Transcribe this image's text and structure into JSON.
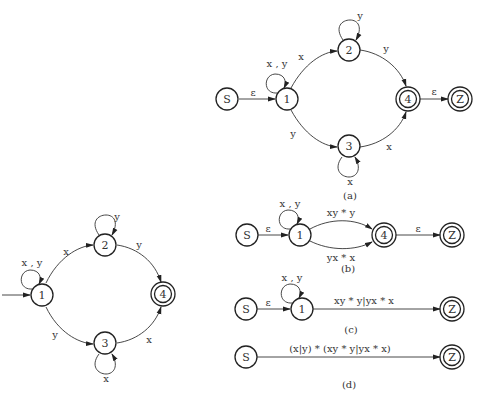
{
  "left_diagram": {
    "states": [
      "1",
      "2",
      "3",
      "4"
    ],
    "edges": {
      "loop_1": "x , y",
      "e_1_2": "x",
      "e_1_3": "y",
      "loop_2": "y",
      "loop_3": "x",
      "e_2_4": "y",
      "e_3_4": "x"
    }
  },
  "diagram_a": {
    "caption": "(a)",
    "states": [
      "S",
      "1",
      "2",
      "3",
      "4",
      "Z"
    ],
    "edges": {
      "e_S_1": "ε",
      "loop_1": "x , y",
      "e_1_2": "x",
      "e_1_3": "y",
      "loop_2": "y",
      "loop_3": "x",
      "e_2_4": "y",
      "e_3_4": "x",
      "e_4_Z": "ε"
    }
  },
  "diagram_b": {
    "caption": "(b)",
    "states": [
      "S",
      "1",
      "4",
      "Z"
    ],
    "edges": {
      "e_S_1": "ε",
      "loop_1": "x , y",
      "e_1_4_top": "xy * y",
      "e_1_4_bottom": "yx * x",
      "e_4_Z": "ε"
    }
  },
  "diagram_c": {
    "caption": "(c)",
    "states": [
      "S",
      "1",
      "Z"
    ],
    "edges": {
      "e_S_1": "ε",
      "loop_1": "x , y",
      "e_1_Z": "xy * y|yx * x"
    }
  },
  "diagram_d": {
    "caption": "(d)",
    "states": [
      "S",
      "Z"
    ],
    "edges": {
      "e_S_Z": "(x|y) * (xy * y|yx * x)"
    }
  }
}
